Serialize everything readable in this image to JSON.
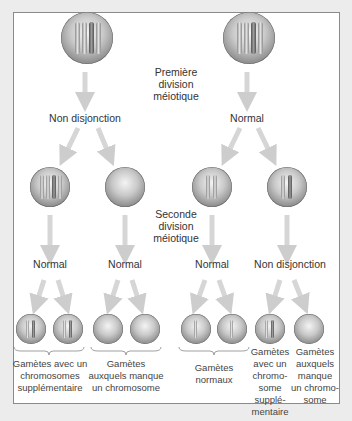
{
  "diagram": {
    "title_first": [
      "Première",
      "division",
      "méiotique"
    ],
    "title_second": [
      "Seconde",
      "division",
      "méiotique"
    ],
    "top_left_outcome": "Non disjonction",
    "top_right_outcome": "Normal",
    "mid_outcomes": [
      "Normal",
      "Normal",
      "Normal",
      "Non disjonction"
    ],
    "gamete_groups": [
      {
        "lines": [
          "Gamètes avec un",
          "chromosomes",
          "supplémentaire"
        ]
      },
      {
        "lines": [
          "Gamètes",
          "auxquels manque",
          "un chromosome"
        ]
      },
      {
        "lines": [
          "Gamètes",
          "normaux"
        ]
      },
      {
        "lines": [
          "Gamètes",
          "avec un",
          "chromo-",
          "some",
          "supplé-",
          "mentaire"
        ]
      },
      {
        "lines": [
          "Gamètes",
          "auxquels",
          "manque",
          "un chromo-",
          "some"
        ]
      }
    ],
    "colors": {
      "background": "#ececec",
      "panel": "#ffffff",
      "border": "#8a8a8a",
      "arrow": "#cfcfcf",
      "text": "#333333"
    }
  }
}
